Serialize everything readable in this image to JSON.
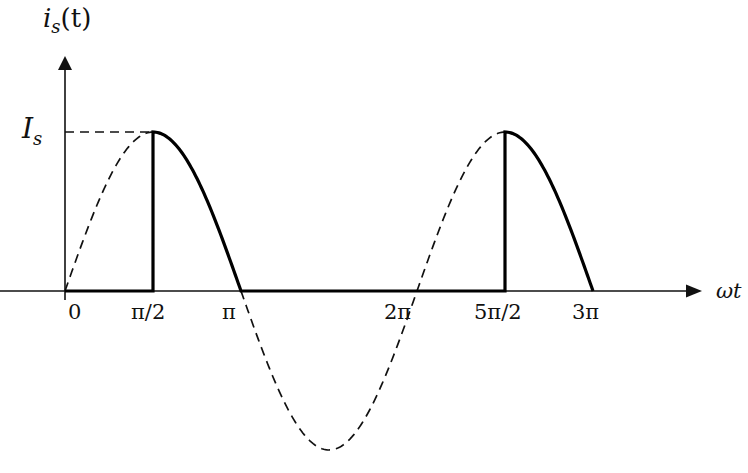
{
  "figure": {
    "y_axis_label": "i",
    "y_axis_label_sub": "s",
    "y_axis_label_suffix": "(t)",
    "amplitude_label": "I",
    "amplitude_label_sub": "s",
    "x_axis_label": "ωt",
    "x_ticks": [
      "0",
      "π/2",
      "π",
      "2π",
      "5π/2",
      "3π"
    ]
  },
  "chart_data": {
    "type": "line",
    "title": "",
    "xlabel": "ωt",
    "ylabel": "i_s(t)",
    "x_tick_labels": [
      "0",
      "π/2",
      "π",
      "2π",
      "5π/2",
      "3π"
    ],
    "x_tick_values_rad": [
      0,
      1.5708,
      3.1416,
      6.2832,
      7.854,
      9.4248
    ],
    "y_tick_labels": [
      "I_s"
    ],
    "y_tick_values": [
      1
    ],
    "xlim_rad": [
      0,
      9.4248
    ],
    "ylim": [
      -1,
      1
    ],
    "grid": false,
    "series": [
      {
        "name": "Reference sinusoid I_s·sin(ωt)",
        "style": "dashed",
        "x_rad": [
          0,
          1.5708,
          3.1416,
          4.7124,
          6.2832,
          7.854,
          9.4248
        ],
        "values": [
          0,
          1,
          0,
          -1,
          0,
          1,
          0
        ]
      },
      {
        "name": "Source current i_s(t) (conducts from π/2 to π and 5π/2 to 3π)",
        "style": "solid-bold",
        "x_rad": [
          0,
          1.5708,
          1.5708,
          2.3562,
          3.1416,
          7.854,
          7.854,
          8.639,
          9.4248
        ],
        "values": [
          0,
          0,
          1,
          0.707,
          0,
          0,
          1,
          0.707,
          0
        ]
      }
    ],
    "annotations": [
      "Dashed horizontal line from I_s on the y-axis to the peak at π/2",
      "Vertical jump from 0 to I_s at ωt = π/2 and ωt = 5π/2"
    ]
  }
}
